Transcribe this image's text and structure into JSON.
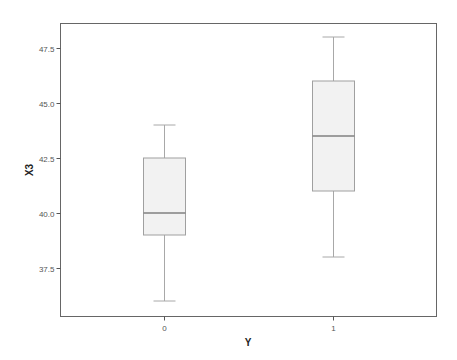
{
  "chart_data": {
    "type": "boxplot",
    "title": "",
    "xlabel": "Y",
    "ylabel": "X3",
    "categories": [
      "0",
      "1"
    ],
    "ylim": [
      35.6,
      48.4
    ],
    "yticks": [
      "37.5",
      "40.0",
      "42.5",
      "45.0",
      "47.5"
    ],
    "grid": false,
    "legend": null,
    "boxes": [
      {
        "category": "0",
        "whisker_low": 36.0,
        "q1": 39.0,
        "median": 40.0,
        "q3": 42.5,
        "whisker_high": 44.0
      },
      {
        "category": "1",
        "whisker_low": 38.0,
        "q1": 41.0,
        "median": 43.5,
        "q3": 46.0,
        "whisker_high": 48.0
      }
    ],
    "colors": {
      "box_fill": "#f2f2f2",
      "box_edge": "#a0a0a0",
      "median": "#808080",
      "whisker": "#a8a8a8",
      "frame": "#666666"
    }
  }
}
